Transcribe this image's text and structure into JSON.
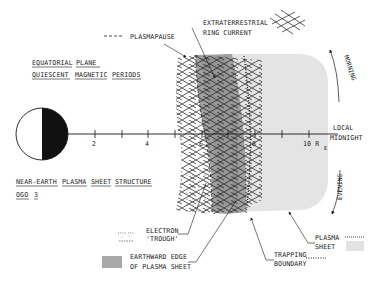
{
  "title": {
    "line1": [
      "EQUATORIAL",
      "PLANE"
    ],
    "line2": [
      "QUIESCENT",
      "MAGNETIC",
      "PERIODS"
    ]
  },
  "subtitle": {
    "line1": [
      "NEAR-EARTH",
      "PLASMA",
      "SHEET",
      "STRUCTURE"
    ],
    "line2": [
      "OGO",
      "3"
    ]
  },
  "axis": {
    "ticks": [
      "2",
      "4",
      "6",
      "8",
      "10 R"
    ],
    "unit_subscript": "E",
    "end_label_line1": "LOCAL",
    "end_label_line2": "MIDNIGHT"
  },
  "directions": {
    "morning": "MORNING",
    "evening": "EVENING"
  },
  "labels": {
    "plasmapause": "PLASMAPAUSE",
    "ring_current_line1": "EXTRATERRESTRIAL",
    "ring_current_line2": "RING CURRENT",
    "electron_trough_line1": "ELECTRON",
    "electron_trough_line2": "'TROUGH'",
    "earthward_edge_line1": "EARTHWARD EDGE",
    "earthward_edge_line2": "OF PLASMA SHEET",
    "trapping_line1": "TRAPPING",
    "trapping_line2": "BOUNDARY",
    "plasma_sheet_line1": "PLASMA",
    "plasma_sheet_line2": "SHEET"
  },
  "colors": {
    "ink": "#1a1a1a",
    "plasma_sheet": "#e4e4e4",
    "earthward_edge": "#a8a8a8",
    "background": "#ffffff"
  }
}
